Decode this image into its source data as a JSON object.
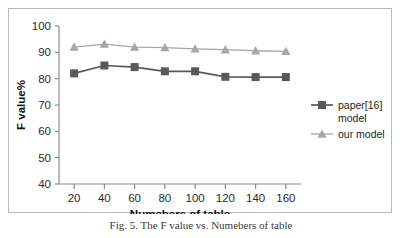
{
  "figure": {
    "caption": "Fig. 5. The F value vs. Numebers of table"
  },
  "chart_data": {
    "type": "line",
    "title": "",
    "xlabel": "Numebers of table",
    "ylabel": "F value%",
    "x": [
      20,
      40,
      60,
      80,
      100,
      120,
      140,
      160
    ],
    "xtick_labels": [
      "20",
      "40",
      "60",
      "80",
      "100",
      "120",
      "140",
      "160"
    ],
    "ytick_labels": [
      "40",
      "50",
      "60",
      "70",
      "80",
      "90",
      "100"
    ],
    "yticks": [
      40,
      50,
      60,
      70,
      80,
      90,
      100
    ],
    "ylim": [
      40,
      100
    ],
    "xlim": [
      10,
      170
    ],
    "grid": false,
    "legend_position": "right",
    "series": [
      {
        "name": "paper[16] model",
        "legend_lines": [
          "paper[16]",
          "model"
        ],
        "marker": "square",
        "color": "#595959",
        "values": [
          82.0,
          85.0,
          84.4,
          82.8,
          82.8,
          80.7,
          80.6,
          80.6
        ]
      },
      {
        "name": "our model",
        "legend_lines": [
          "our model"
        ],
        "marker": "triangle",
        "color": "#a6a6a6",
        "values": [
          92.0,
          93.1,
          92.0,
          91.8,
          91.3,
          91.0,
          90.6,
          90.4
        ]
      }
    ]
  },
  "colors": {
    "series_1": "#595959",
    "series_2": "#a6a6a6",
    "axis": "#8c8c8c",
    "frame": "#b9b9b9",
    "text": "#1d1d1d"
  }
}
